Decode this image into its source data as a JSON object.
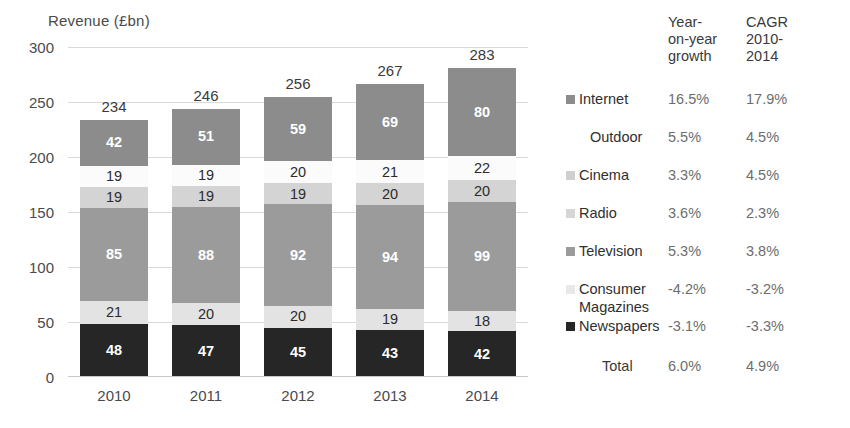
{
  "chart_data": {
    "type": "bar",
    "subtype": "stacked-bar",
    "title": "Revenue (£bn)",
    "xlabel": "",
    "ylabel": "Revenue (£bn)",
    "ylim": [
      0,
      300
    ],
    "yticks": [
      0,
      50,
      100,
      150,
      200,
      250,
      300
    ],
    "ytick_labels": [
      "0",
      "50",
      "100",
      "150",
      "200",
      "250",
      "300"
    ],
    "grid": true,
    "legend_position": "right",
    "categories": [
      "2010",
      "2011",
      "2012",
      "2013",
      "2014"
    ],
    "totals": [
      234,
      246,
      256,
      267,
      283
    ],
    "stack_order_top_to_bottom": [
      "Internet",
      "Outdoor",
      "Cinema",
      "Radio",
      "Television",
      "Consumer Magazines",
      "Newspapers"
    ],
    "series": [
      {
        "name": "Internet",
        "values": [
          42,
          51,
          59,
          69,
          80
        ],
        "color": "#8c8c8c"
      },
      {
        "name": "Outdoor",
        "values": [
          19,
          19,
          20,
          21,
          22
        ],
        "color": "#fbfbfb"
      },
      {
        "name": "Cinema",
        "values": [
          0,
          0,
          0,
          0,
          0
        ],
        "color": "#d4d4d4"
      },
      {
        "name": "Radio",
        "values": [
          19,
          19,
          19,
          20,
          20
        ],
        "color": "#d4d4d4"
      },
      {
        "name": "Television",
        "values": [
          85,
          88,
          92,
          94,
          99
        ],
        "color": "#9b9b9b"
      },
      {
        "name": "Consumer Magazines",
        "values": [
          21,
          20,
          20,
          19,
          18
        ],
        "color": "#e3e3e3"
      },
      {
        "name": "Newspapers",
        "values": [
          48,
          47,
          45,
          43,
          42
        ],
        "color": "#262626"
      }
    ]
  },
  "axis": {
    "y_title": "Revenue (£bn)",
    "y_ticks": [
      "300",
      "250",
      "200",
      "150",
      "100",
      "50",
      "0"
    ],
    "x_ticks": [
      "2010",
      "2011",
      "2012",
      "2013",
      "2014"
    ]
  },
  "bar_totals": [
    "234",
    "246",
    "256",
    "267",
    "283"
  ],
  "bars": [
    {
      "year": "2010",
      "total": "234",
      "segments": [
        {
          "name": "Internet",
          "label": "42",
          "value": 42
        },
        {
          "name": "Outdoor",
          "label": "19",
          "value": 19
        },
        {
          "name": "Radio",
          "label": "19",
          "value": 19
        },
        {
          "name": "Television",
          "label": "85",
          "value": 85
        },
        {
          "name": "Consumer Magazines",
          "label": "21",
          "value": 21
        },
        {
          "name": "Newspapers",
          "label": "48",
          "value": 48
        }
      ]
    },
    {
      "year": "2011",
      "total": "246",
      "segments": [
        {
          "name": "Internet",
          "label": "51",
          "value": 51
        },
        {
          "name": "Outdoor",
          "label": "19",
          "value": 19
        },
        {
          "name": "Radio",
          "label": "19",
          "value": 19
        },
        {
          "name": "Television",
          "label": "88",
          "value": 88
        },
        {
          "name": "Consumer Magazines",
          "label": "20",
          "value": 20
        },
        {
          "name": "Newspapers",
          "label": "47",
          "value": 47
        }
      ]
    },
    {
      "year": "2012",
      "total": "256",
      "segments": [
        {
          "name": "Internet",
          "label": "59",
          "value": 59
        },
        {
          "name": "Outdoor",
          "label": "20",
          "value": 20
        },
        {
          "name": "Radio",
          "label": "19",
          "value": 19
        },
        {
          "name": "Television",
          "label": "92",
          "value": 92
        },
        {
          "name": "Consumer Magazines",
          "label": "20",
          "value": 20
        },
        {
          "name": "Newspapers",
          "label": "45",
          "value": 45
        }
      ]
    },
    {
      "year": "2013",
      "total": "267",
      "segments": [
        {
          "name": "Internet",
          "label": "69",
          "value": 69
        },
        {
          "name": "Outdoor",
          "label": "21",
          "value": 21
        },
        {
          "name": "Radio",
          "label": "20",
          "value": 20
        },
        {
          "name": "Television",
          "label": "94",
          "value": 94
        },
        {
          "name": "Consumer Magazines",
          "label": "19",
          "value": 19
        },
        {
          "name": "Newspapers",
          "label": "43",
          "value": 43
        }
      ]
    },
    {
      "year": "2014",
      "total": "283",
      "segments": [
        {
          "name": "Internet",
          "label": "80",
          "value": 80
        },
        {
          "name": "Outdoor",
          "label": "22",
          "value": 22
        },
        {
          "name": "Radio",
          "label": "20",
          "value": 20
        },
        {
          "name": "Television",
          "label": "99",
          "value": 99
        },
        {
          "name": "Consumer Magazines",
          "label": "18",
          "value": 18
        },
        {
          "name": "Newspapers",
          "label": "42",
          "value": 42
        }
      ]
    }
  ],
  "legend": {
    "header_growth": "Year-\non-year\ngrowth",
    "header_cagr": "CAGR\n2010-\n2014",
    "rows": [
      {
        "name": "Internet",
        "growth": "16.5%",
        "cagr": "17.9%",
        "color": "#8c8c8c",
        "swatch": true,
        "indent": false
      },
      {
        "name": "Outdoor",
        "growth": "5.5%",
        "cagr": "4.5%",
        "color": "#ffffff",
        "swatch": false,
        "indent": true
      },
      {
        "name": "Cinema",
        "growth": "3.3%",
        "cagr": "4.5%",
        "color": "#cfcfcf",
        "swatch": true,
        "indent": false
      },
      {
        "name": "Radio",
        "growth": "3.6%",
        "cagr": "2.3%",
        "color": "#d6d6d6",
        "swatch": true,
        "indent": false
      },
      {
        "name": "Television",
        "growth": "5.3%",
        "cagr": "3.8%",
        "color": "#9b9b9b",
        "swatch": true,
        "indent": false
      },
      {
        "name": "Consumer",
        "name2": "Magazines",
        "growth": "-4.2%",
        "cagr": "-3.2%",
        "color": "#e8e8e8",
        "swatch": true,
        "indent": false
      },
      {
        "name": "Newspapers",
        "growth": "-3.1%",
        "cagr": "-3.3%",
        "color": "#262626",
        "swatch": true,
        "indent": false
      },
      {
        "name": "Total",
        "growth": "6.0%",
        "cagr": "4.9%",
        "color": "#ffffff",
        "swatch": false,
        "indent": true,
        "total": true
      }
    ]
  },
  "colors": {
    "internet": "#8c8c8c",
    "outdoor": "#fbfbfb",
    "cinema": "#d4d4d4",
    "radio": "#d4d4d4",
    "television": "#9b9b9b",
    "consumer_magazines": "#e3e3e3",
    "newspapers": "#262626",
    "gridline": "#d9d9d9",
    "text": "#3a3a3a",
    "value_text_muted": "#6d6d6d"
  }
}
